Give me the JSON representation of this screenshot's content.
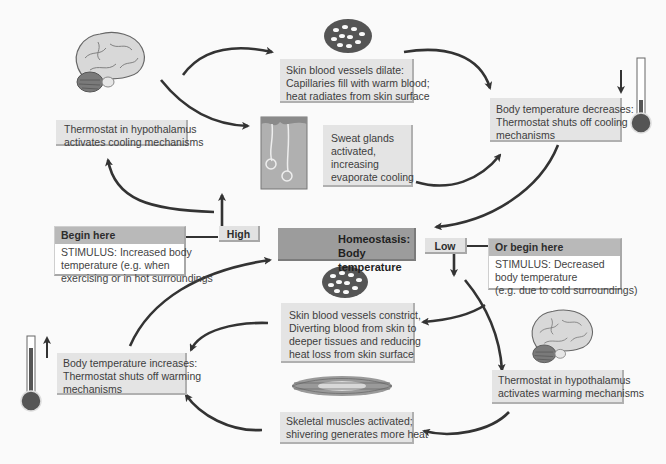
{
  "diagram": {
    "title": "Homeostasis: Body temperature",
    "center": {
      "line1": "Homeostasis:",
      "line2": "Body temperature"
    },
    "high_label": "High",
    "low_label": "Low",
    "stimulus_high": {
      "heading": "Begin here",
      "lines": [
        "STIMULUS: Increased body",
        "temperature (e.g. when",
        "exercising or in hot surroundings"
      ]
    },
    "stimulus_low": {
      "heading": "Or begin here",
      "lines": [
        "STIMULUS: Decreased",
        "body temperature",
        "(e.g. due to cold surroundings)"
      ]
    },
    "cooling_cycle": {
      "thermostat": [
        "Thermostat in hypothalamus",
        "activates cooling mechanisms"
      ],
      "vessels_dilate": [
        "Skin blood vessels dilate:",
        "Capillaries fill with warm blood;",
        "heat radiates from skin surface"
      ],
      "sweat": [
        "Sweat glands",
        "activated,",
        "increasing",
        "evaporate cooling"
      ],
      "result": [
        "Body temperature decreases:",
        "Thermostat shuts off cooling",
        "mechanisms"
      ]
    },
    "warming_cycle": {
      "thermostat": [
        "Thermostat in hypothalamus",
        "activates warming mechanisms"
      ],
      "vessels_constrict": [
        "Skin blood vessels constrict,",
        "Diverting blood from skin to",
        "deeper tissues and reducing",
        "heat loss from skin surface"
      ],
      "shivering": [
        "Skeletal muscles activated;",
        "shivering generates more heat"
      ],
      "result": [
        "Body temperature increases:",
        "Thermostat shuts off warming",
        "mechanisms"
      ]
    },
    "icons": {
      "brain_top": "brain-icon",
      "brain_bottom": "brain-icon",
      "capillary_top": "capillary-network-icon",
      "capillary_center": "capillary-network-icon",
      "sweat_gland": "sweat-gland-icon",
      "muscle": "muscle-fiber-icon",
      "thermometer_low": "thermometer-low-icon",
      "thermometer_high": "thermometer-high-icon"
    },
    "colors": {
      "background": "#fafafa",
      "box": "#e4e4e4",
      "center_box": "#9c9c9c",
      "stimulus_header": "#b9b9b9",
      "arrow": "#333333"
    }
  }
}
